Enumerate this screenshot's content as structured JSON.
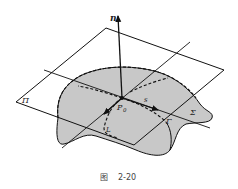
{
  "figure": {
    "caption_prefix": "图",
    "caption_number": "2-20"
  },
  "labels": {
    "normal": "n",
    "plane": "Π",
    "surface": "Σ",
    "curve": "Γ",
    "tangent": "s",
    "line": "L",
    "point": "P",
    "point_sub": "0"
  },
  "colors": {
    "surface_fill": "#c8c8c8",
    "stroke": "#111111",
    "background": "#ffffff"
  }
}
